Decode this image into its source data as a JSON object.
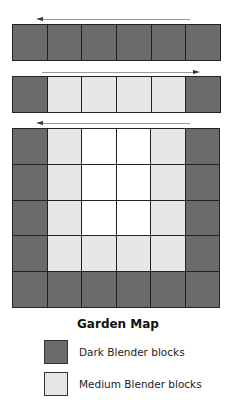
{
  "colors": {
    "dark": "#6b6b6b",
    "medium": "#e6e6e6",
    "white": "#ffffff",
    "gridline": "#222222"
  },
  "strips": [
    {
      "arrow_direction": "left",
      "rows": [
        [
          "dark",
          "dark",
          "dark",
          "dark",
          "dark",
          "dark"
        ]
      ]
    },
    {
      "arrow_direction": "right",
      "rows": [
        [
          "dark",
          "medium",
          "medium",
          "medium",
          "medium",
          "dark"
        ]
      ]
    },
    {
      "arrow_direction": "left",
      "rows": [
        [
          "dark",
          "medium",
          "white",
          "white",
          "medium",
          "dark"
        ],
        [
          "dark",
          "medium",
          "white",
          "white",
          "medium",
          "dark"
        ],
        [
          "dark",
          "medium",
          "white",
          "white",
          "medium",
          "dark"
        ],
        [
          "dark",
          "medium",
          "medium",
          "medium",
          "medium",
          "dark"
        ],
        [
          "dark",
          "dark",
          "dark",
          "dark",
          "dark",
          "dark"
        ]
      ]
    }
  ],
  "legend": {
    "title": "Garden Map",
    "items": [
      {
        "swatch": "dark",
        "label": "Dark Blender blocks"
      },
      {
        "swatch": "medium",
        "label": "Medium Blender blocks"
      }
    ]
  }
}
